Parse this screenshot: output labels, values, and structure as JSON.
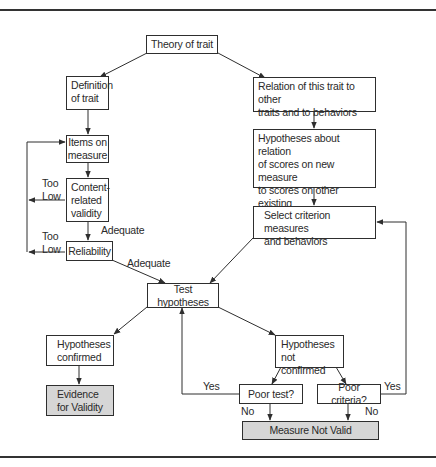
{
  "diagram": {
    "type": "flowchart",
    "title": "",
    "nodes": {
      "theory": "Theory of trait",
      "definition": "Definition\nof trait",
      "relation": "Relation of this trait to other\ntraits and to behaviors",
      "items": "Items on\nmeasure",
      "hypotheses_relation": "Hypotheses about relation\nof scores on new measure\nto scores on other existing\nmeasures and to behaviors",
      "content_validity": "Content-\nrelated\nvalidity",
      "select_criterion": "Select criterion measures\nand behaviors",
      "reliability": "Reliability",
      "test_hypotheses": "Test hypotheses",
      "hyp_confirmed": "Hypotheses\nconfirmed",
      "hyp_not_confirmed": "Hypotheses\nnot confirmed",
      "evidence": "Evidence\nfor Validity",
      "poor_test": "Poor test?",
      "poor_criteria": "Poor criteria?",
      "not_valid": "Measure Not Valid"
    },
    "edge_labels": {
      "content_too_low": "Too\nLow",
      "reliability_too_low": "Too\nLow",
      "content_adequate": "Adequate",
      "reliability_adequate": "Adequate",
      "poor_test_yes": "Yes",
      "poor_test_no": "No",
      "poor_criteria_yes": "Yes",
      "poor_criteria_no": "No"
    },
    "colors": {
      "line": "#2e2e2e",
      "terminal_fill": "#d6d6d6",
      "box_fill": "#ffffff"
    }
  }
}
